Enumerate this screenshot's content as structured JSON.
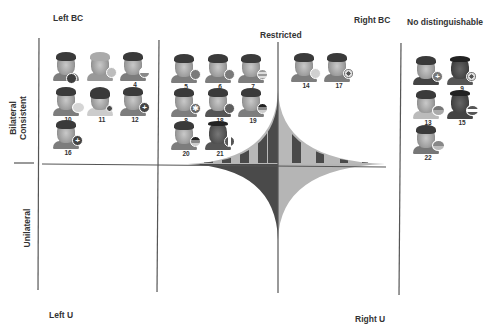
{
  "labels": {
    "left_bc": "Left BC",
    "restricted": "Restricted",
    "right_bc": "Right BC",
    "no_distinguishable": "No distinguishable",
    "bilateral_consistent_line1": "Bilateral",
    "bilateral_consistent_line2": "Consistent",
    "unilateral": "Unilateral",
    "left_u": "Left U",
    "right_u": "Right U"
  },
  "colors": {
    "line": "#555555",
    "dark_fill": "#4a4a4a",
    "light_fill": "#b5b5b5",
    "background": "#ffffff"
  },
  "groups": {
    "left_bc": {
      "players": [
        {
          "number": "",
          "flag": "dark-circle"
        },
        {
          "number": "",
          "flag": "light-circle"
        },
        {
          "number": "4",
          "flag": "striped-circle"
        },
        {
          "number": "10",
          "flag": "light-circle"
        },
        {
          "number": "11",
          "flag": "dark-dot"
        },
        {
          "number": "12",
          "flag": "cross"
        },
        {
          "number": "16",
          "flag": "cross"
        }
      ]
    },
    "restricted": {
      "players": [
        {
          "number": "5",
          "flag": "dark-circle"
        },
        {
          "number": "6",
          "flag": "dark-circle"
        },
        {
          "number": "7",
          "flag": "stripes-circle"
        },
        {
          "number": "8",
          "flag": "union-jack"
        },
        {
          "number": "18",
          "flag": "dark-circle"
        },
        {
          "number": "19",
          "flag": "tricolor"
        },
        {
          "number": "20",
          "flag": "tricolor"
        },
        {
          "number": "21",
          "flag": "vertical-tricolor"
        }
      ]
    },
    "right_bc": {
      "players": [
        {
          "number": "14",
          "flag": "light-circle"
        },
        {
          "number": "17",
          "flag": "emblem"
        }
      ]
    },
    "no_distinguishable": {
      "players": [
        {
          "number": "",
          "flag": "nordic-cross"
        },
        {
          "number": "9",
          "flag": "emblem"
        },
        {
          "number": "13",
          "flag": "striped-circle"
        },
        {
          "number": "15",
          "flag": "tricolor"
        },
        {
          "number": "22",
          "flag": "striped-circle"
        }
      ]
    }
  }
}
